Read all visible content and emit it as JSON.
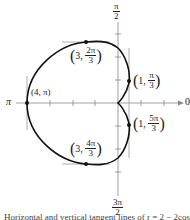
{
  "figure": {
    "curve": "cardioid r = 2 - 2cos(theta)",
    "axis_labels": {
      "top": {
        "num": "π",
        "den": "2"
      },
      "bottom": {
        "num": "3π",
        "den": "2"
      },
      "left": "π",
      "right": "0"
    },
    "points": [
      {
        "r": "4",
        "theta": "π",
        "label": "(4, π)"
      },
      {
        "r": "3",
        "theta_num": "2π",
        "theta_den": "3"
      },
      {
        "r": "3",
        "theta_num": "4π",
        "theta_den": "3"
      },
      {
        "r": "1",
        "theta_num": "π",
        "theta_den": "3"
      },
      {
        "r": "1",
        "theta_num": "5π",
        "theta_den": "3"
      }
    ],
    "caption": "Horizontal and vertical tangent lines of r = 2 − 2cos θ"
  }
}
